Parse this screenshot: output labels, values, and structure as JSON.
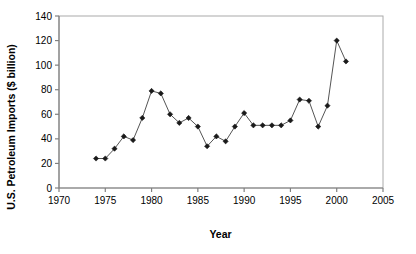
{
  "chart_data": {
    "type": "line",
    "title": "",
    "xlabel": "Year",
    "ylabel": "U.S. Petroleum Imports ($ billion)",
    "xlim": [
      1970,
      2005
    ],
    "ylim": [
      0,
      140
    ],
    "xticks": [
      1970,
      1975,
      1980,
      1985,
      1990,
      1995,
      2000,
      2005
    ],
    "xtick_labels": [
      "1970",
      "1975",
      "1980",
      "1985",
      "1990",
      "1995",
      "2000",
      "2005"
    ],
    "yticks": [
      0,
      20,
      40,
      60,
      80,
      100,
      120,
      140
    ],
    "ytick_labels": [
      "0",
      "20",
      "40",
      "60",
      "80",
      "100",
      "120",
      "140"
    ],
    "grid": false,
    "legend": null,
    "marker": "diamond",
    "marker_color": "#1a1a1a",
    "line_color": "#555555",
    "x": [
      1974,
      1975,
      1976,
      1977,
      1978,
      1979,
      1980,
      1981,
      1982,
      1983,
      1984,
      1985,
      1986,
      1987,
      1988,
      1989,
      1990,
      1991,
      1992,
      1993,
      1994,
      1995,
      1996,
      1997,
      1998,
      1999,
      2000,
      2001
    ],
    "values": [
      24,
      24,
      32,
      42,
      39,
      57,
      79,
      77,
      60,
      53,
      57,
      50,
      34,
      42,
      38,
      50,
      61,
      51,
      51,
      51,
      51,
      55,
      72,
      71,
      50,
      67,
      120,
      103
    ],
    "series": [
      {
        "name": "U.S. Petroleum Imports",
        "points": [
          {
            "year": 1974,
            "value": 24
          },
          {
            "year": 1975,
            "value": 24
          },
          {
            "year": 1976,
            "value": 32
          },
          {
            "year": 1977,
            "value": 42
          },
          {
            "year": 1978,
            "value": 39
          },
          {
            "year": 1979,
            "value": 57
          },
          {
            "year": 1980,
            "value": 79
          },
          {
            "year": 1981,
            "value": 77
          },
          {
            "year": 1982,
            "value": 60
          },
          {
            "year": 1983,
            "value": 53
          },
          {
            "year": 1984,
            "value": 57
          },
          {
            "year": 1985,
            "value": 50
          },
          {
            "year": 1986,
            "value": 34
          },
          {
            "year": 1987,
            "value": 42
          },
          {
            "year": 1988,
            "value": 38
          },
          {
            "year": 1989,
            "value": 50
          },
          {
            "year": 1990,
            "value": 61
          },
          {
            "year": 1991,
            "value": 51
          },
          {
            "year": 1992,
            "value": 51
          },
          {
            "year": 1993,
            "value": 51
          },
          {
            "year": 1994,
            "value": 51
          },
          {
            "year": 1995,
            "value": 55
          },
          {
            "year": 1996,
            "value": 72
          },
          {
            "year": 1997,
            "value": 71
          },
          {
            "year": 1998,
            "value": 50
          },
          {
            "year": 1999,
            "value": 67
          },
          {
            "year": 2000,
            "value": 120
          },
          {
            "year": 2001,
            "value": 103
          }
        ]
      }
    ]
  },
  "figure": {
    "background": "#ffffff",
    "axis_color": "#808080",
    "frame_color": "#aaaaaa"
  }
}
